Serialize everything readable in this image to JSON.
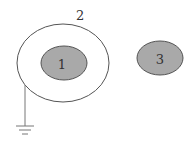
{
  "diagram": {
    "type": "electrostatics-conductors",
    "conductors": [
      {
        "id": "1",
        "label": "1",
        "shape": "ellipse",
        "fill": "#a9a9a9",
        "stroke": "#555555",
        "description": "inner conductor enclosed by shell 2"
      },
      {
        "id": "2",
        "label": "2",
        "shape": "ellipse-shell",
        "fill": "none",
        "stroke": "#555555",
        "description": "outer conductor shell, grounded"
      },
      {
        "id": "3",
        "label": "3",
        "shape": "ellipse",
        "fill": "#a9a9a9",
        "stroke": "#555555",
        "description": "separate conductor outside shell"
      }
    ],
    "ground": {
      "connected_to": "2",
      "symbol": "ground",
      "stroke": "#777777"
    },
    "colors": {
      "background": "#ffffff",
      "conductor_fill": "#a9a9a9",
      "outline": "#555555",
      "label": "#333333"
    }
  }
}
